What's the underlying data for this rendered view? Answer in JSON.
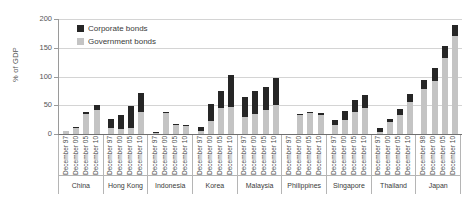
{
  "chart_data": {
    "type": "bar",
    "subtype": "stacked-bar-grouped",
    "title": "",
    "xlabel": "",
    "ylabel": "% of GDP",
    "ylim": [
      0,
      200
    ],
    "yticks": [
      0,
      50,
      100,
      150,
      200
    ],
    "grid": "horizontal",
    "legend_position": "top-left-inside",
    "legend": [
      "Corporate bonds",
      "Government bonds"
    ],
    "colors": {
      "corporate_bonds": "#262626",
      "government_bonds": "#c4c4c4",
      "gridline": "#d4d4d4",
      "axis": "#6f6f6f"
    },
    "series": [
      {
        "name": "Government bonds",
        "stack_order": 1
      },
      {
        "name": "Corporate bonds",
        "stack_order": 2
      }
    ],
    "groups": [
      {
        "country": "China",
        "bars": [
          {
            "period": "December 97",
            "government": 5,
            "corporate": 1,
            "total": 6
          },
          {
            "period": "December 00",
            "government": 10,
            "corporate": 2,
            "total": 12
          },
          {
            "period": "December 05",
            "government": 35,
            "corporate": 4,
            "total": 39
          },
          {
            "period": "December 10",
            "government": 41,
            "corporate": 10,
            "total": 51
          }
        ]
      },
      {
        "country": "Hong Kong",
        "bars": [
          {
            "period": "December 97",
            "government": 10,
            "corporate": 16,
            "total": 26
          },
          {
            "period": "December 00",
            "government": 9,
            "corporate": 24,
            "total": 33
          },
          {
            "period": "December 05",
            "government": 10,
            "corporate": 38,
            "total": 48
          },
          {
            "period": "December 10",
            "government": 38,
            "corporate": 34,
            "total": 72
          }
        ]
      },
      {
        "country": "Indonesia",
        "bars": [
          {
            "period": "December 97",
            "government": 1,
            "corporate": 2,
            "total": 3
          },
          {
            "period": "December 00",
            "government": 36,
            "corporate": 2,
            "total": 38
          },
          {
            "period": "December 05",
            "government": 16,
            "corporate": 2,
            "total": 18
          },
          {
            "period": "December 10",
            "government": 14,
            "corporate": 2,
            "total": 16
          }
        ]
      },
      {
        "country": "Korea",
        "bars": [
          {
            "period": "December 97",
            "government": 5,
            "corporate": 7,
            "total": 12
          },
          {
            "period": "December 00",
            "government": 23,
            "corporate": 30,
            "total": 53
          },
          {
            "period": "December 05",
            "government": 46,
            "corporate": 28,
            "total": 74
          },
          {
            "period": "December 10",
            "government": 47,
            "corporate": 56,
            "total": 103
          }
        ]
      },
      {
        "country": "Malaysia",
        "bars": [
          {
            "period": "December 97",
            "government": 30,
            "corporate": 35,
            "total": 65
          },
          {
            "period": "December 00",
            "government": 35,
            "corporate": 40,
            "total": 75
          },
          {
            "period": "December 05",
            "government": 42,
            "corporate": 39,
            "total": 81
          },
          {
            "period": "December 10",
            "government": 51,
            "corporate": 46,
            "total": 97
          }
        ]
      },
      {
        "country": "Philippines",
        "bars": [
          {
            "period": "December 97",
            "government": 0,
            "corporate": 0,
            "total": 0
          },
          {
            "period": "December 00",
            "government": 33,
            "corporate": 1,
            "total": 34
          },
          {
            "period": "December 05",
            "government": 36,
            "corporate": 2,
            "total": 38
          },
          {
            "period": "December 10",
            "government": 33,
            "corporate": 4,
            "total": 37
          }
        ]
      },
      {
        "country": "Singapore",
        "bars": [
          {
            "period": "December 97",
            "government": 15,
            "corporate": 10,
            "total": 25
          },
          {
            "period": "December 00",
            "government": 24,
            "corporate": 16,
            "total": 40
          },
          {
            "period": "December 05",
            "government": 38,
            "corporate": 21,
            "total": 59
          },
          {
            "period": "December 10",
            "government": 45,
            "corporate": 22,
            "total": 67
          }
        ]
      },
      {
        "country": "Thailand",
        "bars": [
          {
            "period": "December 97",
            "government": 4,
            "corporate": 6,
            "total": 10
          },
          {
            "period": "December 00",
            "government": 21,
            "corporate": 6,
            "total": 27
          },
          {
            "period": "December 05",
            "government": 33,
            "corporate": 10,
            "total": 43
          },
          {
            "period": "December 10",
            "government": 55,
            "corporate": 14,
            "total": 69
          }
        ]
      },
      {
        "country": "Japan",
        "bars": [
          {
            "period": "December 98",
            "government": 78,
            "corporate": 16,
            "total": 94
          },
          {
            "period": "December 00",
            "government": 92,
            "corporate": 22,
            "total": 114
          },
          {
            "period": "December 05",
            "government": 132,
            "corporate": 21,
            "total": 153
          },
          {
            "period": "December 10",
            "government": 170,
            "corporate": 20,
            "total": 190
          }
        ]
      }
    ]
  }
}
